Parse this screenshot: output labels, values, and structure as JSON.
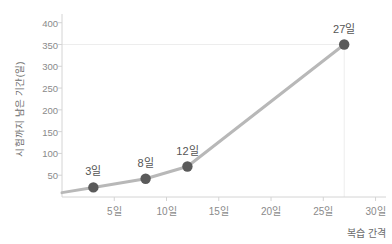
{
  "chart_data": {
    "type": "line",
    "title": "",
    "xlabel": "복습 간격",
    "ylabel": "시험까지 남은 기간(일)",
    "x": [
      3,
      8,
      12,
      27
    ],
    "values": [
      22,
      42,
      70,
      350
    ],
    "point_labels": [
      "3일",
      "8일",
      "12일",
      "27일"
    ],
    "xlim": [
      0,
      31
    ],
    "ylim": [
      0,
      420
    ],
    "xticks": [
      5,
      10,
      15,
      20,
      25,
      30
    ],
    "xtick_labels": [
      "5일",
      "10일",
      "15일",
      "20일",
      "25일",
      "30일"
    ],
    "yticks": [
      50,
      100,
      150,
      200,
      250,
      300,
      350,
      400
    ],
    "ytick_labels": [
      "50",
      "100",
      "150",
      "200",
      "250",
      "300",
      "350",
      "400"
    ],
    "grid": "faint-horizontal-at-350-and-vertical-guide-at-27",
    "legend": "none",
    "legend_position": "none",
    "series_name": "시험까지 남은 기간",
    "colors": {
      "line": "#b8b8b8",
      "marker": "#5a5a5a",
      "axis": "#d4d4d4",
      "tick_text": "#8a8a8a",
      "label_text": "#6b6b6b",
      "annotation_text": "#555555",
      "grid": "#ededed",
      "background": "#ffffff"
    }
  }
}
